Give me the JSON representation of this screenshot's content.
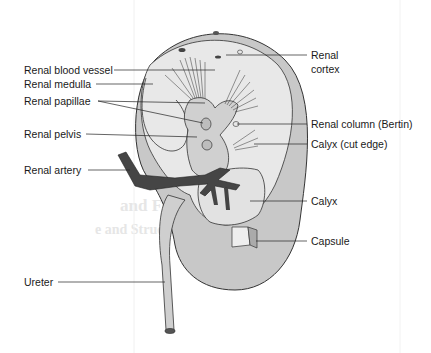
{
  "diagram": {
    "colors": {
      "background": "#ffffff",
      "capsule_fill": "#c8c8c8",
      "cortex_fill": "#e6e6e6",
      "pelvis_fill": "#d2d2d2",
      "artery_fill": "#444444",
      "outline": "#333333",
      "leader_line": "#222222"
    },
    "labels_left": [
      {
        "id": "renal-blood-vessel",
        "text": "Renal blood vessel"
      },
      {
        "id": "renal-medulla",
        "text": "Renal medulla"
      },
      {
        "id": "renal-papillae",
        "text": "Renal papillae"
      },
      {
        "id": "renal-pelvis",
        "text": "Renal pelvis"
      },
      {
        "id": "renal-artery",
        "text": "Renal artery"
      },
      {
        "id": "ureter",
        "text": "Ureter"
      }
    ],
    "labels_right": [
      {
        "id": "renal-cortex",
        "text": "Renal cortex",
        "line1": "Renal",
        "line2": "cortex"
      },
      {
        "id": "renal-column",
        "text": "Renal column (Bertin)"
      },
      {
        "id": "calyx-cut-edge",
        "text": "Calyx (cut edge)"
      },
      {
        "id": "calyx",
        "text": "Calyx"
      },
      {
        "id": "capsule",
        "text": "Capsule"
      }
    ]
  }
}
